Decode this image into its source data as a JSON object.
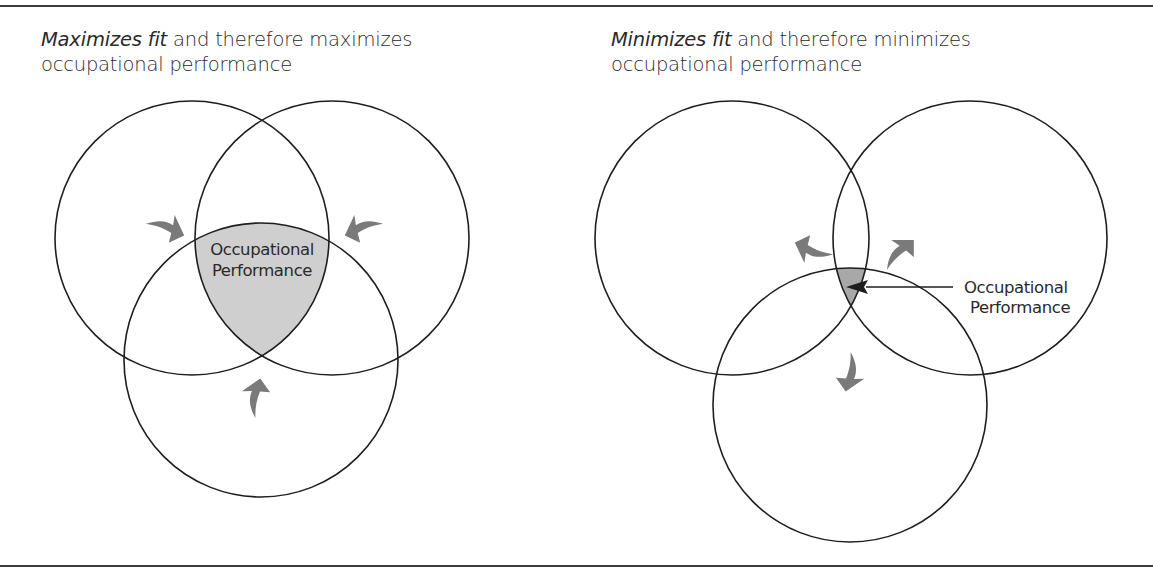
{
  "panels": [
    {
      "id": "maximize",
      "caption_emphasis": "Maximizes fit",
      "caption_rest_line1": " and therefore maximizes",
      "caption_line2": "occupational performance",
      "center_label_line1": "Occupational",
      "center_label_line2": "Performance",
      "arrow_direction": "inward",
      "overlap_shading": "#cfcfcf",
      "circles": [
        {
          "cx": 192,
          "cy": 238,
          "r": 137
        },
        {
          "cx": 332,
          "cy": 238,
          "r": 137
        },
        {
          "cx": 261,
          "cy": 360,
          "r": 137
        }
      ]
    },
    {
      "id": "minimize",
      "caption_emphasis": "Minimizes fit",
      "caption_rest_line1": " and therefore minimizes",
      "caption_line2": "occupational performance",
      "center_label_line1": "Occupational",
      "center_label_line2": "Performance",
      "arrow_direction": "outward",
      "overlap_shading": "#a8a8a8",
      "circles": [
        {
          "cx": 732,
          "cy": 238,
          "r": 137
        },
        {
          "cx": 970,
          "cy": 238,
          "r": 137
        },
        {
          "cx": 850,
          "cy": 405,
          "r": 137
        }
      ]
    }
  ],
  "colors": {
    "line": "#1e1e1e",
    "arrow_fill": "#7a7a7a",
    "rule": "#3a3a3a"
  }
}
